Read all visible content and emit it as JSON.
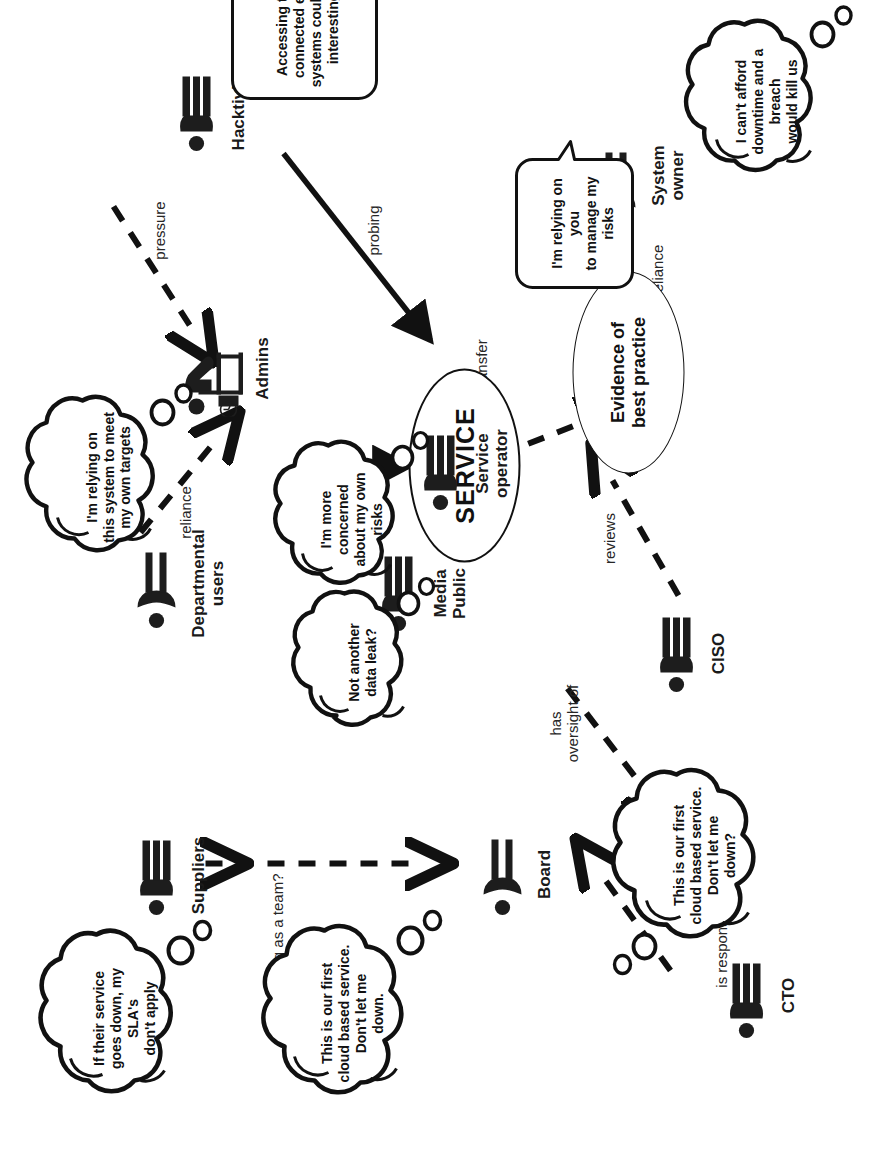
{
  "diagram": {
    "center_node": "SERVICE",
    "outcome_node": "Evidence of\nbest practice",
    "actors": [
      {
        "id": "suppliers",
        "label": "Suppliers",
        "glyph": "person-male-icon"
      },
      {
        "id": "departmental",
        "label": "Departmental\nusers",
        "glyph": "person-female-icon"
      },
      {
        "id": "board",
        "label": "Board",
        "glyph": "person-female-icon"
      },
      {
        "id": "cto",
        "label": "CTO",
        "glyph": "person-male-icon"
      },
      {
        "id": "ciso",
        "label": "CISO",
        "glyph": "person-male-icon"
      },
      {
        "id": "mediapublic",
        "label": "Media\nPublic",
        "glyph": "person-male-icon"
      },
      {
        "id": "admins",
        "label": "Admins",
        "glyph": "person-at-desk-icon"
      },
      {
        "id": "serviceop",
        "label": "Service\noperator",
        "glyph": "person-male-icon"
      },
      {
        "id": "sysowner",
        "label": "System\nowner",
        "glyph": "person-female-icon"
      },
      {
        "id": "hacktivists",
        "label": "Hacktivists",
        "glyph": "person-male-icon"
      }
    ],
    "bubbles": [
      {
        "id": "b-suppliers",
        "kind": "thought",
        "owner": "suppliers",
        "text": "If their service\ngoes down, my SLA's\ndon't apply"
      },
      {
        "id": "b-board",
        "kind": "thought",
        "owner": "board",
        "text": "This is our first\ncloud  based service.\nDon't let me\ndown."
      },
      {
        "id": "b-cto",
        "kind": "thought",
        "owner": "cto",
        "text": "This is our first\ncloud  based service.\nDon't let me\ndown?"
      },
      {
        "id": "b-depusers",
        "kind": "thought",
        "owner": "departmental",
        "text": "I'm relying on\nthis system to meet\nmy own targets"
      },
      {
        "id": "b-media",
        "kind": "thought",
        "owner": "mediapublic",
        "text": "Not another\ndata leak?"
      },
      {
        "id": "b-serviceop",
        "kind": "thought",
        "owner": "serviceop",
        "text": "I'm more\nconcerned\nabout my own\nrisks"
      },
      {
        "id": "b-sysowner",
        "kind": "thought",
        "owner": "sysowner",
        "text": "I can't afford\ndowntime and a\nbreach\nwould kill us"
      },
      {
        "id": "b-sysowner-sp",
        "kind": "speech",
        "owner": "sysowner",
        "text": "I'm relying on you\nto manage my risks"
      },
      {
        "id": "b-hacktivists",
        "kind": "speech",
        "owner": "hacktivists",
        "text": "Accessing the\nconnected end\nsystems could be\ninteresting"
      }
    ],
    "edges": [
      {
        "id": "e-team",
        "label": "working as a team?",
        "style": "dashed",
        "heads": "both",
        "from": "departmental",
        "to": "suppliers"
      },
      {
        "id": "e-resp",
        "label": "is responsible to",
        "style": "dashed",
        "heads": "one",
        "from": "cto",
        "to": "board"
      },
      {
        "id": "e-oversight",
        "label": "has\noversight of",
        "style": "dashed",
        "heads": "one",
        "from": "board",
        "to": "ciso"
      },
      {
        "id": "e-reviews",
        "label": "reviews",
        "style": "dashed",
        "heads": "one",
        "from": "ciso",
        "to": "evidence"
      },
      {
        "id": "e-risktr",
        "label": "risk transfer",
        "style": "dashed",
        "heads": "both",
        "from": "serviceop",
        "to": "evidence"
      },
      {
        "id": "e-reliance",
        "label": "reliance",
        "style": "dashed",
        "heads": "one",
        "from": "departmental",
        "to": "admins"
      },
      {
        "id": "e-pressure",
        "label": "pressure",
        "style": "dashed",
        "heads": "one",
        "from": "hacktivists",
        "to": "admins"
      },
      {
        "id": "e-full",
        "label": "full\naccess",
        "style": "solid",
        "heads": "one",
        "from": "admins",
        "to": "service"
      },
      {
        "id": "e-probing",
        "label": "probing",
        "style": "solid",
        "heads": "one",
        "from": "hacktivists",
        "to": "service"
      },
      {
        "id": "e-stated",
        "label": "stated reliance",
        "style": "solid",
        "heads": "one",
        "from": "sysowner",
        "to": "serviceop",
        "cut": "scissors-icon"
      }
    ],
    "colors": {
      "ink": "#111111",
      "paper": "#ffffff",
      "edge_label": "#262626"
    }
  }
}
